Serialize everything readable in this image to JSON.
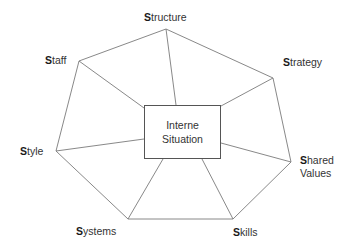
{
  "diagram": {
    "type": "7S model heptagon",
    "center": {
      "line1": "Interne",
      "line2": "Situation"
    },
    "nodes": [
      {
        "id": "structure",
        "initial": "S",
        "rest": "tructure",
        "vertex": [
          166,
          29
        ]
      },
      {
        "id": "strategy",
        "initial": "S",
        "rest": "trategy",
        "vertex": [
          273,
          78
        ]
      },
      {
        "id": "shared-values",
        "initial": "S",
        "rest": "hared",
        "rest2": "Values",
        "vertex": [
          291,
          162
        ]
      },
      {
        "id": "skills",
        "initial": "S",
        "rest": "kills",
        "vertex": [
          233,
          219
        ]
      },
      {
        "id": "systems",
        "initial": "S",
        "rest": "ystems",
        "vertex": [
          128,
          219
        ]
      },
      {
        "id": "style",
        "initial": "S",
        "rest": "tyle",
        "vertex": [
          56,
          151
        ]
      },
      {
        "id": "staff",
        "initial": "S",
        "rest": "taff",
        "vertex": [
          79,
          61
        ]
      }
    ],
    "colors": {
      "line": "#777777",
      "text": "#333333",
      "box_border": "#555555"
    }
  }
}
